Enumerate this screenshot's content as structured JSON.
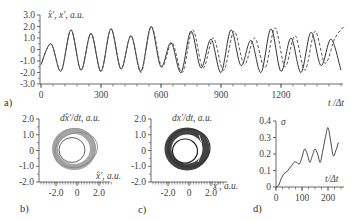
{
  "chart_data": [
    {
      "panel": "a)",
      "type": "line",
      "ylabel": "x̂', x', a.u.",
      "xlabel": "t /Δt",
      "yticks": [
        "3.0",
        "2.0",
        "1.0",
        "0",
        "-1.0",
        "-2.0",
        "-3.0"
      ],
      "xticks": [
        "0",
        "300",
        "600",
        "900",
        "1200"
      ],
      "ylim": [
        -3.0,
        3.0
      ],
      "xlim": [
        0,
        1500
      ],
      "series": [
        {
          "name": "x̂' (solid)",
          "style": "solid",
          "x": [
            0,
            50,
            100,
            150,
            200,
            250,
            300,
            350,
            400,
            450,
            500,
            550,
            600,
            650,
            700,
            750,
            800,
            850,
            900,
            950,
            1000,
            1050,
            1100,
            1150,
            1200,
            1250,
            1300,
            1350,
            1400,
            1450,
            1500
          ],
          "values": [
            -1.3,
            0.5,
            -1.9,
            1.7,
            -1.8,
            1.4,
            -1.9,
            1.8,
            -1.7,
            1.2,
            -1.9,
            2.0,
            -1.5,
            0.6,
            -2.0,
            1.6,
            -1.6,
            0.9,
            -2.0,
            1.7,
            -1.4,
            0.8,
            -2.0,
            1.8,
            -1.9,
            1.0,
            -2.0,
            1.5,
            -1.4,
            0.9,
            -1.8
          ]
        },
        {
          "name": "x' (dashed)",
          "style": "dashed",
          "x": [
            0,
            50,
            100,
            150,
            200,
            250,
            300,
            350,
            400,
            450,
            500,
            550,
            600,
            650,
            700,
            750,
            800,
            850,
            900,
            950,
            1000,
            1050,
            1100,
            1150,
            1200,
            1250,
            1300,
            1350,
            1400,
            1450,
            1500
          ],
          "values": [
            -1.3,
            0.5,
            -1.9,
            1.7,
            -1.8,
            1.4,
            -1.9,
            1.8,
            -1.7,
            1.2,
            -2.0,
            2.0,
            -1.5,
            0.6,
            -2.0,
            1.7,
            -1.6,
            1.0,
            -1.8,
            1.6,
            -1.3,
            1.0,
            -1.6,
            1.9,
            -1.5,
            1.2,
            -1.8,
            1.6,
            -1.2,
            1.0,
            2.1
          ]
        }
      ]
    },
    {
      "panel": "b)",
      "type": "scatter",
      "ylabel": "dx̂'/dt, a.u.",
      "xlabel": "x̂', a.u.",
      "yticks": [
        "2.0",
        "1.0",
        "0",
        "-1.0",
        "-2.0"
      ],
      "xticks": [
        "-2.0",
        "0",
        "2.0"
      ],
      "ylim": [
        -2.0,
        2.0
      ],
      "xlim": [
        -3.0,
        3.0
      ],
      "description": "phase portrait ring (limit-cycle band), grey"
    },
    {
      "panel": "c)",
      "type": "scatter",
      "ylabel": "dx'/dt, a.u.",
      "xlabel": "x', a.u.",
      "yticks": [
        "2.0",
        "1.0",
        "0",
        "-1.0",
        "-2.0"
      ],
      "xticks": [
        "-2.0",
        "0",
        "2.0"
      ],
      "ylim": [
        -2.0,
        2.0
      ],
      "xlim": [
        -3.0,
        3.0
      ],
      "description": "phase portrait ring (limit-cycle band), dark"
    },
    {
      "panel": "d)",
      "type": "line",
      "ylabel": "σ",
      "xlabel": "t/Δt",
      "yticks": [
        "0.4",
        "0.3",
        "0.2",
        "0.1",
        "0"
      ],
      "xticks": [
        "0",
        "100",
        "200"
      ],
      "ylim": [
        0,
        0.4
      ],
      "xlim": [
        0,
        250
      ],
      "x": [
        0,
        10,
        20,
        30,
        40,
        50,
        60,
        70,
        80,
        90,
        100,
        110,
        120,
        130,
        140,
        150,
        160,
        170,
        180,
        190,
        200,
        210,
        220,
        230,
        240
      ],
      "values": [
        0,
        0.01,
        0.05,
        0.08,
        0.09,
        0.11,
        0.13,
        0.15,
        0.15,
        0.14,
        0.18,
        0.23,
        0.2,
        0.15,
        0.19,
        0.23,
        0.2,
        0.15,
        0.22,
        0.3,
        0.36,
        0.28,
        0.19,
        0.22,
        0.27
      ]
    }
  ],
  "labels": {
    "a": {
      "panel": "a)",
      "ylabel_main": "x̂', x', a.u.",
      "xlabel": "t /Δt",
      "yticks": [
        "3.0",
        "2.0",
        "1.0",
        "0",
        "-1.0",
        "-2.0",
        "-3.0"
      ],
      "xticks": [
        "0",
        "300",
        "600",
        "900",
        "1200"
      ]
    },
    "b": {
      "panel": "b)",
      "ylabel": "dx̂'/dt, a.u.",
      "xlabel": "x̂', a.u.",
      "yticks": [
        "2.0",
        "1.0",
        "0",
        "-1.0",
        "-2.0"
      ],
      "xticks": [
        "-2.0",
        "0",
        "2.0"
      ]
    },
    "c": {
      "panel": "c)",
      "ylabel": "dx'/dt, a.u.",
      "xlabel": "x', a.u.",
      "yticks": [
        "2.0",
        "1.0",
        "0",
        "-1.0",
        "-2.0"
      ],
      "xticks": [
        "-2.0",
        "0",
        "2.0"
      ]
    },
    "d": {
      "panel": "d)",
      "ylabel": "σ",
      "xlabel": "t/Δt",
      "yticks": [
        "0.4",
        "0.3",
        "0.2",
        "0.1",
        "0"
      ],
      "xticks": [
        "0",
        "100",
        "200"
      ]
    }
  }
}
